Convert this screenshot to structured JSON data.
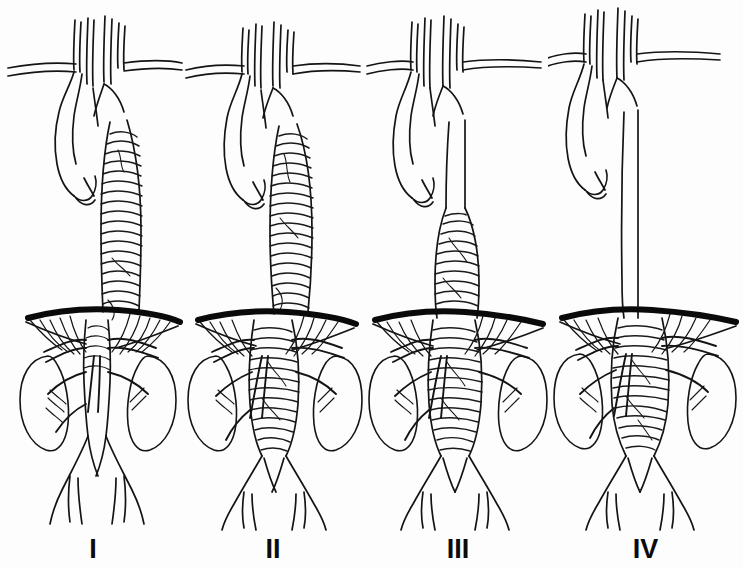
{
  "figure": {
    "title": "Crawford classification of thoracoabdominal aortic aneurysms",
    "background_color": "#fdfdfd",
    "ink_color": "#111111",
    "width": 743,
    "height": 569,
    "style": "pen-and-ink medical line drawing, four panels"
  },
  "panels": [
    {
      "label": "I",
      "label_x": 115,
      "aneurysm_extent": "from just distal to the left subclavian artery through the upper abdominal aorta above the renal arteries",
      "thoracic_aorta": "aneurysmal",
      "abdominal_aorta": "normal below renal arteries",
      "shading": "transverse hatching"
    },
    {
      "label": "II",
      "label_x": 265,
      "aneurysm_extent": "from the left subclavian artery to the aortic bifurcation",
      "thoracic_aorta": "aneurysmal",
      "abdominal_aorta": "aneurysmal to bifurcation",
      "shading": "transverse hatching"
    },
    {
      "label": "III",
      "label_x": 415,
      "aneurysm_extent": "from the mid descending thoracic aorta to the aortic bifurcation",
      "thoracic_aorta": "aneurysmal from mid descending segment",
      "abdominal_aorta": "aneurysmal to bifurcation",
      "shading": "transverse hatching"
    },
    {
      "label": "IV",
      "label_x": 580,
      "aneurysm_extent": "entire abdominal aorta from the diaphragm to the bifurcation",
      "thoracic_aorta": "normal calibre",
      "abdominal_aorta": "aneurysmal",
      "shading": "transverse hatching"
    }
  ],
  "anatomy": {
    "arch_branches": [
      "brachiocephalic-trunk",
      "right-subclavian-artery",
      "right-common-carotid-artery",
      "left-common-carotid-artery",
      "left-subclavian-artery"
    ],
    "visceral_branches": [
      "celiac-trunk",
      "superior-mesenteric-artery",
      "right-renal-artery",
      "left-renal-artery",
      "inferior-mesenteric-artery"
    ],
    "terminal_branches": [
      "right-common-iliac-artery",
      "left-common-iliac-artery",
      "internal-iliac-artery",
      "external-iliac-artery"
    ],
    "organs": [
      "right-kidney",
      "left-kidney",
      "diaphragm"
    ]
  }
}
